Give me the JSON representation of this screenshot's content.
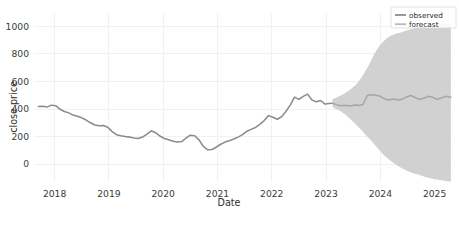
{
  "chart_data": {
    "type": "line",
    "title": "",
    "xlabel": "Date",
    "ylabel": "close price",
    "xlim": [
      2017.62,
      2025.32
    ],
    "ylim": [
      -130,
      1090
    ],
    "xticks": [
      "2018",
      "2019",
      "2020",
      "2021",
      "2022",
      "2023",
      "2024",
      "2025"
    ],
    "xtick_values": [
      2018,
      2019,
      2020,
      2021,
      2022,
      2023,
      2024,
      2025
    ],
    "yticks": [
      "0",
      "200",
      "400",
      "600",
      "800",
      "1000"
    ],
    "ytick_values": [
      0,
      200,
      400,
      600,
      800,
      1000
    ],
    "grid": true,
    "legend_position": "top-right",
    "legend": [
      {
        "label": "observed",
        "color": "#8c8c8c"
      },
      {
        "label": "forecast",
        "color": "#b9b9b9"
      }
    ],
    "colors": {
      "observed_line": "#8c8c8c",
      "forecast_line": "#a8a8a8",
      "confidence_band": "#cdcdcd",
      "background": "#ffffff",
      "grid": "#efefef",
      "text": "#333333"
    },
    "series": [
      {
        "name": "observed",
        "type": "line",
        "x": [
          2017.7,
          2017.78,
          2017.86,
          2017.94,
          2018.02,
          2018.1,
          2018.18,
          2018.26,
          2018.34,
          2018.42,
          2018.5,
          2018.58,
          2018.66,
          2018.74,
          2018.82,
          2018.9,
          2018.98,
          2019.06,
          2019.14,
          2019.22,
          2019.3,
          2019.38,
          2019.46,
          2019.54,
          2019.62,
          2019.7,
          2019.78,
          2019.86,
          2019.94,
          2020.02,
          2020.1,
          2020.18,
          2020.26,
          2020.34,
          2020.42,
          2020.5,
          2020.58,
          2020.66,
          2020.74,
          2020.82,
          2020.9,
          2020.98,
          2021.06,
          2021.14,
          2021.22,
          2021.3,
          2021.38,
          2021.46,
          2021.54,
          2021.62,
          2021.7,
          2021.78,
          2021.86,
          2021.94,
          2022.02,
          2022.1,
          2022.18,
          2022.26,
          2022.34,
          2022.42,
          2022.5,
          2022.58,
          2022.66,
          2022.74,
          2022.82,
          2022.9,
          2022.98,
          2023.06,
          2023.12
        ],
        "y": [
          418,
          420,
          414,
          428,
          424,
          398,
          382,
          372,
          356,
          348,
          336,
          320,
          300,
          284,
          278,
          280,
          268,
          236,
          214,
          206,
          200,
          196,
          190,
          186,
          196,
          218,
          242,
          228,
          204,
          186,
          176,
          166,
          160,
          164,
          188,
          210,
          206,
          176,
          128,
          104,
          106,
          124,
          144,
          160,
          170,
          182,
          196,
          214,
          238,
          252,
          266,
          288,
          316,
          352,
          340,
          326,
          344,
          382,
          428,
          486,
          470,
          492,
          508,
          466,
          452,
          462,
          436,
          440,
          442
        ]
      },
      {
        "name": "forecast",
        "type": "line",
        "x": [
          2023.12,
          2023.2,
          2023.28,
          2023.36,
          2023.44,
          2023.52,
          2023.6,
          2023.68,
          2023.76,
          2023.84,
          2023.92,
          2024.0,
          2024.08,
          2024.16,
          2024.24,
          2024.32,
          2024.4,
          2024.48,
          2024.56,
          2024.64,
          2024.72,
          2024.8,
          2024.88,
          2024.96,
          2025.04,
          2025.12,
          2025.2,
          2025.3
        ],
        "y": [
          442,
          430,
          424,
          428,
          422,
          430,
          426,
          432,
          498,
          504,
          500,
          492,
          472,
          466,
          472,
          466,
          470,
          488,
          498,
          484,
          470,
          478,
          492,
          486,
          470,
          480,
          492,
          486
        ]
      }
    ],
    "confidence_band": {
      "name": "forecast interval",
      "x": [
        2023.12,
        2023.28,
        2023.44,
        2023.6,
        2023.76,
        2023.92,
        2024.08,
        2024.24,
        2024.4,
        2024.56,
        2024.72,
        2024.88,
        2025.04,
        2025.2,
        2025.3
      ],
      "upper": [
        472,
        500,
        540,
        600,
        700,
        820,
        900,
        940,
        960,
        980,
        995,
        1005,
        1012,
        1018,
        1020
      ],
      "lower": [
        412,
        380,
        330,
        268,
        200,
        130,
        60,
        10,
        -30,
        -60,
        -80,
        -100,
        -112,
        -122,
        -126
      ]
    }
  }
}
